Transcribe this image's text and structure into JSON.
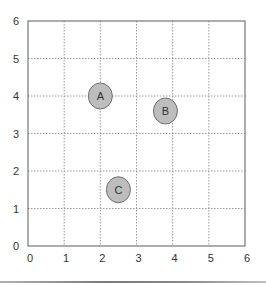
{
  "chart_data": {
    "type": "scatter",
    "title": "",
    "xlabel": "",
    "ylabel": "",
    "xlim": [
      0,
      6
    ],
    "ylim": [
      0,
      6
    ],
    "x_ticks": [
      0,
      1,
      2,
      3,
      4,
      5,
      6
    ],
    "y_ticks": [
      0,
      1,
      2,
      3,
      4,
      5,
      6
    ],
    "grid": true,
    "grid_style": "dotted",
    "legend": null,
    "points": [
      {
        "label": "A",
        "x": 2.0,
        "y": 4.0
      },
      {
        "label": "B",
        "x": 3.8,
        "y": 3.6
      },
      {
        "label": "C",
        "x": 2.5,
        "y": 1.5
      }
    ]
  },
  "style": {
    "point_fill": "#bdbdbd",
    "point_stroke": "#6f6f6f",
    "axis_color": "#777777",
    "grid_color": "#9a9a9a"
  }
}
